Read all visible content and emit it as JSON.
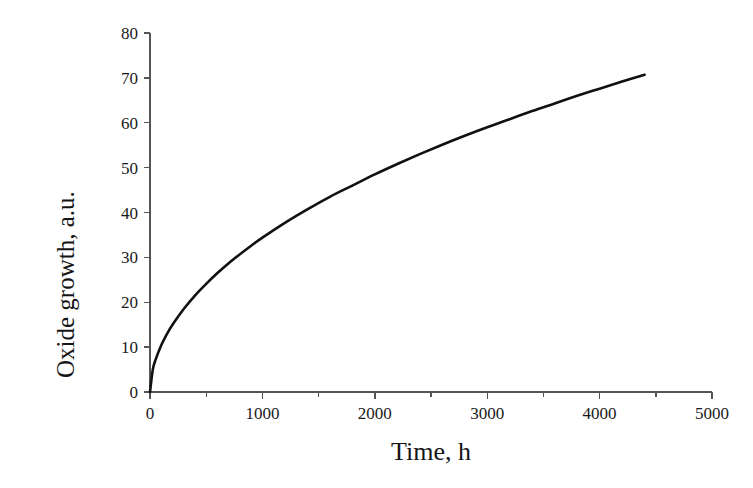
{
  "figure": {
    "top_clipped_text": "",
    "background_color": "#ffffff",
    "curve_color": "#111111",
    "axis_color": "#555555",
    "text_color": "#1a1a1a"
  },
  "chart_data": {
    "type": "line",
    "title": "",
    "subtitle": "",
    "xlabel": "Time, h",
    "ylabel": "Oxide growth, a.u.",
    "xlim": [
      0,
      5000
    ],
    "ylim": [
      0,
      80
    ],
    "grid": false,
    "legend": null,
    "legend_position": "none",
    "annotations": [],
    "xticks": [
      0,
      500,
      1000,
      1500,
      2000,
      2500,
      3000,
      3500,
      4000,
      4500,
      5000
    ],
    "xtick_labels": [
      "0",
      "",
      "1000",
      "",
      "2000",
      "",
      "3000",
      "",
      "4000",
      "",
      "5000"
    ],
    "xtick_major": [
      0,
      1000,
      2000,
      3000,
      4000,
      5000
    ],
    "xtick_minor": [
      500,
      1500,
      2500,
      3500,
      4500
    ],
    "yticks": [
      0,
      10,
      20,
      30,
      40,
      50,
      60,
      70,
      80
    ],
    "ytick_labels": [
      "0",
      "10",
      "20",
      "30",
      "40",
      "50",
      "60",
      "70",
      "80"
    ],
    "series": [
      {
        "name": "Oxide growth",
        "color": "#111111",
        "line_width": 2.6,
        "marker": "none",
        "x": [
          0,
          25,
          50,
          100,
          150,
          200,
          300,
          400,
          500,
          600,
          700,
          800,
          900,
          1000,
          1200,
          1400,
          1600,
          1800,
          2000,
          2200,
          2400,
          2600,
          2800,
          3000,
          3200,
          3400,
          3600,
          3800,
          4000,
          4200,
          4400
        ],
        "y": [
          0.0,
          5.0,
          7.2,
          10.4,
          12.9,
          15.0,
          18.5,
          21.5,
          24.1,
          26.5,
          28.7,
          30.7,
          32.6,
          34.4,
          37.7,
          40.7,
          43.5,
          46.0,
          48.5,
          50.8,
          53.0,
          55.1,
          57.1,
          59.0,
          60.8,
          62.6,
          64.3,
          66.0,
          67.6,
          69.2,
          70.7
        ]
      }
    ]
  }
}
